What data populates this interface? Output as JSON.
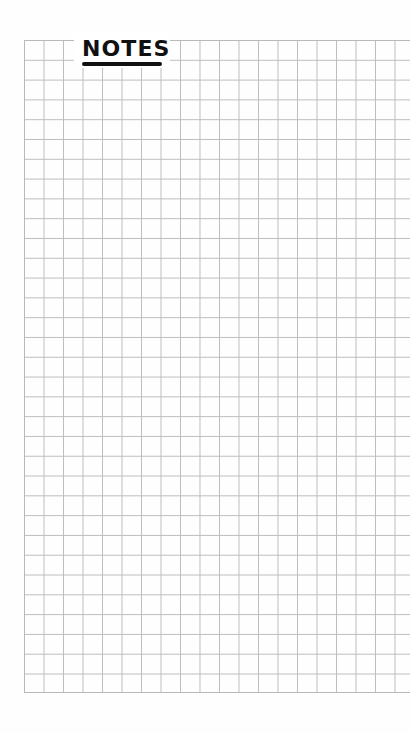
{
  "page": {
    "title": "NOTES",
    "style": "graph-paper",
    "colors": {
      "background": "#ffffff",
      "grid_line": "#bdbdbd",
      "title_ink": "#111111"
    },
    "grid": {
      "columns": 20,
      "rows": 33
    }
  }
}
